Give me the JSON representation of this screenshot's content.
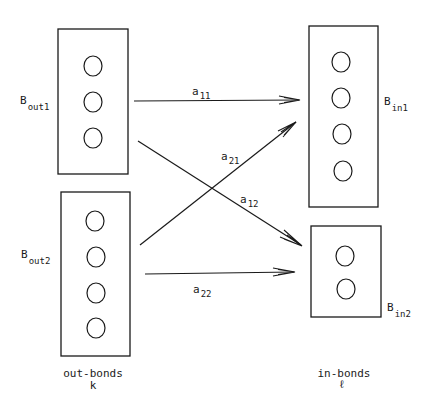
{
  "diagram": {
    "nodes": [
      {
        "id": "Bout1",
        "label_main": "B",
        "label_sub": "out1",
        "circles": 3,
        "side": "out"
      },
      {
        "id": "Bout2",
        "label_main": "B",
        "label_sub": "out2",
        "circles": 4,
        "side": "out"
      },
      {
        "id": "Bin1",
        "label_main": "B",
        "label_sub": "in1",
        "circles": 4,
        "side": "in"
      },
      {
        "id": "Bin2",
        "label_main": "B",
        "label_sub": "in2",
        "circles": 2,
        "side": "in"
      }
    ],
    "edges": [
      {
        "from": "Bout1",
        "to": "Bin1",
        "label_main": "a",
        "label_sub": "11"
      },
      {
        "from": "Bout1",
        "to": "Bin2",
        "label_main": "a",
        "label_sub": "12"
      },
      {
        "from": "Bout2",
        "to": "Bin1",
        "label_main": "a",
        "label_sub": "21"
      },
      {
        "from": "Bout2",
        "to": "Bin2",
        "label_main": "a",
        "label_sub": "22"
      }
    ],
    "captions": {
      "left_line1": "out-bonds",
      "left_line2": "k",
      "right_line1": "in-bonds",
      "right_line2": "ℓ"
    }
  }
}
